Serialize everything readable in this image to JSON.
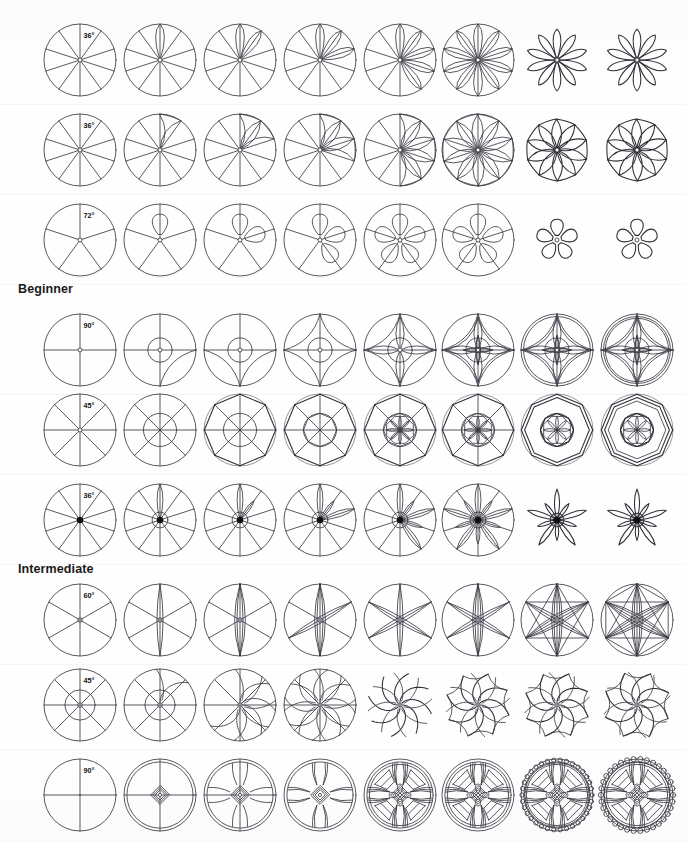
{
  "page": {
    "background_color": "#fefefe",
    "ink_color": "#3b3b44",
    "width": 687,
    "height": 842
  },
  "labels": [
    {
      "text": "Beginner",
      "x": 18,
      "y": 282
    },
    {
      "text": "Intermediate",
      "x": 18,
      "y": 562
    }
  ],
  "columns": {
    "count": 8,
    "centers_x": [
      80,
      160,
      240,
      320,
      400,
      478,
      557,
      637
    ]
  },
  "rows": [
    {
      "index": 1,
      "center_y": 60,
      "angle_label": "36°",
      "divisions": 10,
      "petal_style": "pointed-petal",
      "hub": "open",
      "radius": 36,
      "description": "10-division circle progressing to 10-petal rosette"
    },
    {
      "index": 2,
      "center_y": 150,
      "angle_label": "36°",
      "divisions": 10,
      "petal_style": "swirl-petal",
      "hub": "open",
      "radius": 36,
      "description": "10-division circle progressing to 10-petal pinwheel"
    },
    {
      "index": 3,
      "center_y": 240,
      "angle_label": "72°",
      "divisions": 5,
      "petal_style": "round-petal",
      "hub": "open",
      "radius": 36,
      "description": "5-division circle progressing to 5-petal blossom"
    },
    {
      "index": 4,
      "center_y": 350,
      "angle_label": "90°",
      "divisions": 4,
      "petal_style": "gothic-quatrefoil",
      "hub": "open",
      "radius": 36,
      "description": "4-division circle progressing to gothic quatrefoil tracery"
    },
    {
      "index": 5,
      "center_y": 430,
      "angle_label": "45°",
      "divisions": 8,
      "petal_style": "octagon-ring",
      "hub": "none",
      "radius": 36,
      "description": "8-division circle progressing to octagonal banded rosette"
    },
    {
      "index": 6,
      "center_y": 520,
      "angle_label": "36°",
      "divisions": 10,
      "petal_style": "star-flower",
      "hub": "filled",
      "radius": 36,
      "description": "10-division circle progressing to 10-point star flower"
    },
    {
      "index": 7,
      "center_y": 620,
      "angle_label": "60°",
      "divisions": 6,
      "petal_style": "lens-petal",
      "hub": "gray",
      "radius": 36,
      "description": "6-division circle progressing to 6-lens flower of life"
    },
    {
      "index": 8,
      "center_y": 705,
      "angle_label": "45°",
      "divisions": 8,
      "petal_style": "spiral-vane",
      "hub": "gray",
      "radius": 36,
      "description": "8-division circle progressing to 8-vane spiral rosette"
    },
    {
      "index": 9,
      "center_y": 795,
      "angle_label": "90°",
      "divisions": 4,
      "petal_style": "wheel-window",
      "hub": "open",
      "radius": 36,
      "description": "4-division circle progressing to beaded rose window"
    }
  ],
  "chart_data": {
    "type": "table",
    "xlabel": "Construction step (1 → 8)",
    "ylabel": "Pattern family",
    "categories": [
      "Step 1",
      "Step 2",
      "Step 3",
      "Step 4",
      "Step 5",
      "Step 6",
      "Step 7",
      "Step 8"
    ],
    "series": [
      {
        "name": "36° – 10 divisions (petal rosette)",
        "values": [
          1,
          2,
          3,
          4,
          5,
          6,
          7,
          8
        ]
      },
      {
        "name": "36° – 10 divisions (pinwheel)",
        "values": [
          1,
          2,
          3,
          4,
          5,
          6,
          7,
          8
        ]
      },
      {
        "name": "72° – 5 divisions (blossom)",
        "values": [
          1,
          2,
          3,
          4,
          5,
          6,
          7,
          8
        ]
      },
      {
        "name": "90° – 4 divisions (quatrefoil)",
        "values": [
          1,
          2,
          3,
          4,
          5,
          6,
          7,
          8
        ]
      },
      {
        "name": "45° – 8 divisions (octagon ring)",
        "values": [
          1,
          2,
          3,
          4,
          5,
          6,
          7,
          8
        ]
      },
      {
        "name": "36° – 10 divisions (star flower)",
        "values": [
          1,
          2,
          3,
          4,
          5,
          6,
          7,
          8
        ]
      },
      {
        "name": "60° – 6 divisions (lens flower)",
        "values": [
          1,
          2,
          3,
          4,
          5,
          6,
          7,
          8
        ]
      },
      {
        "name": "45° – 8 divisions (spiral vane)",
        "values": [
          1,
          2,
          3,
          4,
          5,
          6,
          7,
          8
        ]
      },
      {
        "name": "90° – 4 divisions (rose window)",
        "values": [
          1,
          2,
          3,
          4,
          5,
          6,
          7,
          8
        ]
      }
    ],
    "annotations": [
      "Beginner",
      "Intermediate"
    ],
    "grid": false,
    "legend": "none"
  }
}
